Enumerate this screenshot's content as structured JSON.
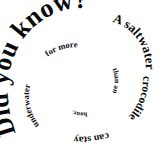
{
  "graphic": {
    "kind": "spiral-text-graphic",
    "background_color": "#ffffff",
    "text_color": "#0a0a0a",
    "headline": "Did you know?",
    "fact": "A saltwater crocodile can stay underwater for more than an hour.",
    "full_text": "Did you know? A saltwater crocodile can stay underwater for more than an hour.",
    "spiral": {
      "direction": "counterclockwise-inward",
      "start_position": "bottom-left",
      "turns": "2.5"
    },
    "segments": [
      {
        "id": "headline",
        "text": "Did you know?"
      },
      {
        "id": "fact-1",
        "text": "A saltwater"
      },
      {
        "id": "fact-2",
        "text": "crocodile"
      },
      {
        "id": "fact-3",
        "text": "can stay"
      },
      {
        "id": "fact-4",
        "text": "underwater"
      },
      {
        "id": "fact-5",
        "text": "for more"
      },
      {
        "id": "fact-6",
        "text": "than an"
      },
      {
        "id": "fact-7",
        "text": "hour."
      }
    ]
  }
}
